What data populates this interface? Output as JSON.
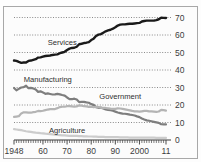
{
  "figure": {
    "background_color": "#fcfcfc",
    "border_color": "#a8a8a8"
  },
  "chart_data": {
    "type": "line",
    "title": "",
    "subtitle": "",
    "xlabel": "",
    "ylabel": "",
    "xlim": [
      1948,
      2011
    ],
    "ylim": [
      0,
      72
    ],
    "yticks": [
      0,
      10,
      20,
      30,
      40,
      50,
      60,
      70
    ],
    "ytick_labels": [
      "0",
      "10",
      "20",
      "30",
      "40",
      "50",
      "60",
      "70"
    ],
    "y_axis_position": "right",
    "xticks": [
      1948,
      1960,
      1970,
      1980,
      1990,
      2000,
      2011
    ],
    "xtick_labels": [
      "1948",
      "60",
      "70",
      "80",
      "90",
      "2000",
      "11"
    ],
    "x_minor_tick_interval": 1,
    "grid": "horizontal-dotted",
    "legend": "inline-labels",
    "x": [
      1948,
      1949,
      1950,
      1951,
      1952,
      1953,
      1954,
      1955,
      1956,
      1957,
      1958,
      1959,
      1960,
      1961,
      1962,
      1963,
      1964,
      1965,
      1966,
      1967,
      1968,
      1969,
      1970,
      1971,
      1972,
      1973,
      1974,
      1975,
      1976,
      1977,
      1978,
      1979,
      1980,
      1981,
      1982,
      1983,
      1984,
      1985,
      1986,
      1987,
      1988,
      1989,
      1990,
      1991,
      1992,
      1993,
      1994,
      1995,
      1996,
      1997,
      1998,
      1999,
      2000,
      2001,
      2002,
      2003,
      2004,
      2005,
      2006,
      2007,
      2008,
      2009,
      2010,
      2011
    ],
    "series": [
      {
        "name": "Services",
        "color": "#1a1a1a",
        "width": 2.4,
        "label_x": 1968,
        "label_y": 54.5,
        "values": [
          45.4,
          45.2,
          44.6,
          44.1,
          44.3,
          44.3,
          45.2,
          45.4,
          45.8,
          46.2,
          47.1,
          47.2,
          47.6,
          48.0,
          48.1,
          48.3,
          48.6,
          48.8,
          48.9,
          49.6,
          50.0,
          50.4,
          51.4,
          52.2,
          52.6,
          52.7,
          53.3,
          54.7,
          55.0,
          55.4,
          55.6,
          55.9,
          57.1,
          57.9,
          59.4,
          60.2,
          60.5,
          61.3,
          62.1,
          62.6,
          63.0,
          63.6,
          64.4,
          65.4,
          65.9,
          66.1,
          66.1,
          66.3,
          66.4,
          66.4,
          66.6,
          66.8,
          66.9,
          67.7,
          68.0,
          68.2,
          68.2,
          68.2,
          68.2,
          68.5,
          69.0,
          69.9,
          69.8,
          69.7
        ]
      },
      {
        "name": "Manufacturing",
        "color": "#7e7e7e",
        "width": 2.2,
        "label_x": 1962,
        "label_y": 33.0,
        "values": [
          29.7,
          28.4,
          29.2,
          30.0,
          30.2,
          31.0,
          29.6,
          29.8,
          29.4,
          28.9,
          27.5,
          27.8,
          27.2,
          26.4,
          26.6,
          26.3,
          26.0,
          26.1,
          26.4,
          26.1,
          25.7,
          25.4,
          24.3,
          23.4,
          23.3,
          23.6,
          23.1,
          21.7,
          21.8,
          21.8,
          21.5,
          21.3,
          20.5,
          20.1,
          18.8,
          18.4,
          18.5,
          18.0,
          17.5,
          17.2,
          17.0,
          16.7,
          16.2,
          15.7,
          15.4,
          15.1,
          15.0,
          14.8,
          14.5,
          14.3,
          14.0,
          13.5,
          13.1,
          12.3,
          11.7,
          11.2,
          11.0,
          10.7,
          10.4,
          10.1,
          9.8,
          9.0,
          8.9,
          8.9
        ]
      },
      {
        "name": "Government",
        "color": "#b4b4b4",
        "width": 2.2,
        "label_x": 1992,
        "label_y": 23.6,
        "values": [
          13.2,
          13.4,
          13.6,
          15.2,
          15.8,
          15.8,
          15.6,
          15.6,
          15.9,
          16.1,
          16.6,
          16.5,
          16.7,
          17.1,
          17.4,
          17.6,
          17.7,
          17.7,
          18.2,
          18.8,
          19.0,
          19.0,
          19.3,
          19.3,
          19.2,
          19.0,
          19.2,
          19.8,
          19.6,
          19.3,
          19.2,
          18.9,
          19.0,
          18.7,
          19.0,
          18.8,
          18.4,
          18.4,
          18.3,
          18.1,
          17.9,
          17.8,
          17.8,
          18.1,
          18.0,
          17.8,
          17.5,
          17.2,
          16.9,
          16.6,
          16.4,
          16.3,
          16.2,
          16.4,
          16.6,
          16.6,
          16.4,
          16.3,
          16.2,
          16.1,
          16.3,
          17.2,
          17.1,
          16.8
        ]
      },
      {
        "name": "Agriculture",
        "color": "#cccccc",
        "width": 2.2,
        "label_x": 1970,
        "label_y": 4.2,
        "values": [
          6.2,
          6.0,
          5.8,
          5.6,
          5.3,
          5.0,
          4.8,
          4.6,
          4.4,
          4.2,
          4.1,
          3.9,
          3.8,
          3.6,
          3.5,
          3.3,
          3.2,
          3.1,
          2.9,
          2.8,
          2.7,
          2.6,
          2.5,
          2.4,
          2.4,
          2.3,
          2.3,
          2.2,
          2.2,
          2.1,
          2.1,
          2.0,
          2.0,
          1.9,
          1.9,
          1.8,
          1.8,
          1.8,
          1.7,
          1.7,
          1.7,
          1.6,
          1.6,
          1.6,
          1.5,
          1.5,
          1.5,
          1.5,
          1.4,
          1.4,
          1.4,
          1.4,
          1.4,
          1.3,
          1.3,
          1.3,
          1.3,
          1.3,
          1.3,
          1.2,
          1.2,
          1.2,
          1.2,
          1.2
        ]
      }
    ]
  }
}
